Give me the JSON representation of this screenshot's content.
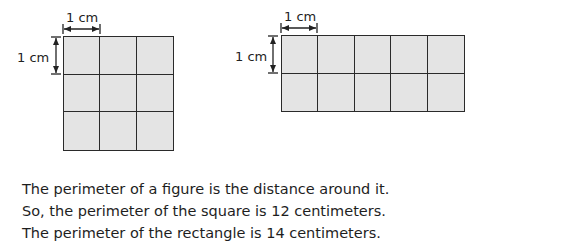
{
  "square": {
    "rows": 3,
    "cols": 3,
    "width_label": "1 cm",
    "height_label": "1 cm"
  },
  "rectangle": {
    "rows": 2,
    "cols": 5,
    "width_label": "1 cm",
    "height_label": "1 cm"
  },
  "text": {
    "line1": "The perimeter of a figure is the distance around it.",
    "line2": "So, the perimeter of the square is 12 centimeters.",
    "line3": "The perimeter of the rectangle is 14 centimeters."
  },
  "colors": {
    "cell_fill": "#e4e4e4",
    "line": "#2a2a2a"
  }
}
